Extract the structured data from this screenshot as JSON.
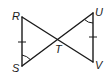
{
  "diagram": {
    "type": "geometry",
    "stroke_color": "#1a1a1a",
    "points": {
      "R": {
        "label": "R",
        "x": 22,
        "y": 17
      },
      "S": {
        "label": "S",
        "x": 22,
        "y": 66
      },
      "T": {
        "label": "T",
        "x": 58,
        "y": 40
      },
      "U": {
        "label": "U",
        "x": 93,
        "y": 13
      },
      "V": {
        "label": "V",
        "x": 93,
        "y": 62
      }
    },
    "segments": [
      "RS",
      "RV",
      "SU",
      "UV"
    ],
    "congruence_marks": {
      "ticks": [
        "RS",
        "UV"
      ],
      "angles": [
        "RST (at S)",
        "TUV (at U)"
      ]
    }
  }
}
